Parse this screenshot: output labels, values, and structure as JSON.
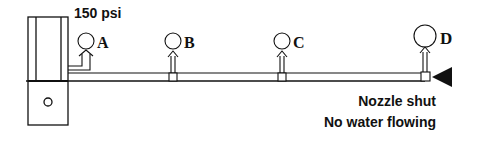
{
  "diagram": {
    "pressure_label": "150 psi",
    "gauges": [
      {
        "id": "A",
        "label": "A"
      },
      {
        "id": "B",
        "label": "B"
      },
      {
        "id": "C",
        "label": "C"
      },
      {
        "id": "D",
        "label": "D"
      }
    ],
    "caption": {
      "line1": "Nozzle shut",
      "line2": "No water flowing"
    },
    "colors": {
      "stroke": "#111111",
      "background": "#ffffff"
    }
  }
}
